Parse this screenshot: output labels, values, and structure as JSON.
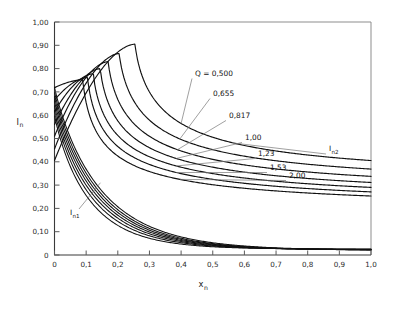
{
  "chart_data": {
    "type": "line",
    "title": "",
    "subtitle": "",
    "xlabel": "x",
    "xlabel_sub": "n",
    "ylabel": "I",
    "ylabel_sub": "n",
    "xlim": [
      0,
      1.0
    ],
    "ylim": [
      0,
      1.0
    ],
    "grid": false,
    "legend_position": "inline-annotations",
    "xticklabels": [
      "0",
      "0,1",
      "0,2",
      "0,3",
      "0,4",
      "0,5",
      "0,6",
      "0,7",
      "0,8",
      "0,9",
      "1,0"
    ],
    "xtickvalues": [
      0,
      0.1,
      0.2,
      0.3,
      0.4,
      0.5,
      0.6,
      0.7,
      0.8,
      0.9,
      1.0
    ],
    "yticklabels": [
      "0",
      "0,10",
      "0,20",
      "0,30",
      "0,40",
      "0,50",
      "0,60",
      "0,70",
      "0,80",
      "0,90",
      "1,00"
    ],
    "ytickvalues": [
      0,
      0.1,
      0.2,
      0.3,
      0.4,
      0.5,
      0.6,
      0.7,
      0.8,
      0.9,
      1.0
    ],
    "parameter_symbol": "Q",
    "family_upper_name": "I",
    "family_upper_sub": "n2",
    "family_lower_name": "I",
    "family_lower_sub": "n1",
    "annotations": [
      {
        "label": "Q = 0,500",
        "q": 0.5
      },
      {
        "label": "0,655",
        "q": 0.655
      },
      {
        "label": "0,817",
        "q": 0.817
      },
      {
        "label": "1,00",
        "q": 1.0
      },
      {
        "label": "1,23",
        "q": 1.23
      },
      {
        "label": "1,53",
        "q": 1.53
      },
      {
        "label": "2,00",
        "q": 2.0
      },
      {
        "label": "I",
        "sub": "n2",
        "q": null
      },
      {
        "label": "I",
        "sub": "n1",
        "q": null
      }
    ],
    "series": [
      {
        "name": "Q = 0,500",
        "q": 0.5,
        "peak_x": 0.255,
        "peak_y": 0.905,
        "y_at_0": 0.405,
        "y_at_1": 0.295
      },
      {
        "name": "0,655",
        "q": 0.655,
        "peak_x": 0.205,
        "peak_y": 0.865,
        "y_at_0": 0.455,
        "y_at_1": 0.265
      },
      {
        "name": "0,817",
        "q": 0.817,
        "peak_x": 0.17,
        "peak_y": 0.83,
        "y_at_0": 0.51,
        "y_at_1": 0.24
      },
      {
        "name": "1,00",
        "q": 1.0,
        "peak_x": 0.145,
        "peak_y": 0.8,
        "y_at_0": 0.56,
        "y_at_1": 0.22
      },
      {
        "name": "1,23",
        "q": 1.23,
        "peak_x": 0.123,
        "peak_y": 0.778,
        "y_at_0": 0.615,
        "y_at_1": 0.205
      },
      {
        "name": "1,53",
        "q": 1.53,
        "peak_x": 0.105,
        "peak_y": 0.762,
        "y_at_0": 0.665,
        "y_at_1": 0.192
      },
      {
        "name": "2,00",
        "q": 2.0,
        "peak_x": 0.09,
        "peak_y": 0.752,
        "y_at_0": 0.718,
        "y_at_1": 0.182
      }
    ],
    "lower_family": [
      {
        "q": 0.5,
        "y_at_0": 0.72,
        "y_at_1": 0.02
      },
      {
        "q": 0.655,
        "y_at_0": 0.7,
        "y_at_1": 0.02
      },
      {
        "q": 0.817,
        "y_at_0": 0.68,
        "y_at_1": 0.021
      },
      {
        "q": 1.0,
        "y_at_0": 0.66,
        "y_at_1": 0.022
      },
      {
        "q": 1.23,
        "y_at_0": 0.64,
        "y_at_1": 0.023
      },
      {
        "q": 1.53,
        "y_at_0": 0.62,
        "y_at_1": 0.024
      },
      {
        "q": 2.0,
        "y_at_0": 0.6,
        "y_at_1": 0.025
      }
    ]
  }
}
